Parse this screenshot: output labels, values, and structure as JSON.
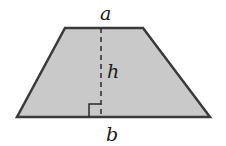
{
  "diagram": {
    "shape": "trapezoid",
    "labels": {
      "top_base": "a",
      "height": "h",
      "bottom_base": "b"
    },
    "colors": {
      "fill": "#c9c9c9",
      "stroke": "#3a3a3a"
    },
    "annotations": [
      "right-angle marker at foot of height"
    ]
  }
}
